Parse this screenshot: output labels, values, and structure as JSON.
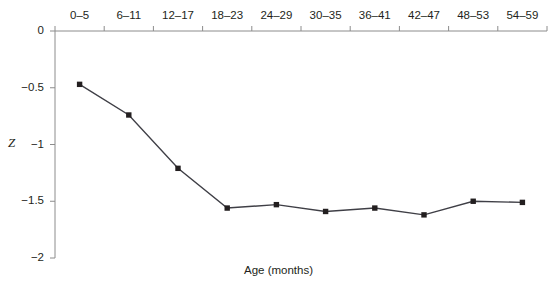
{
  "chart_data": {
    "type": "line",
    "title": "",
    "xlabel": "Age (months)",
    "ylabel": "Z",
    "categories": [
      "0–5",
      "6–11",
      "12–17",
      "18–23",
      "24–29",
      "30–35",
      "36–41",
      "42–47",
      "48–53",
      "54–59"
    ],
    "values": [
      -0.47,
      -0.74,
      -1.21,
      -1.56,
      -1.53,
      -1.59,
      -1.56,
      -1.62,
      -1.5,
      -1.51
    ],
    "series": [
      {
        "name": "Z",
        "values": [
          -0.47,
          -0.74,
          -1.21,
          -1.56,
          -1.53,
          -1.59,
          -1.56,
          -1.62,
          -1.5,
          -1.51
        ]
      }
    ],
    "ylim": [
      -2,
      0
    ],
    "yticks": [
      0,
      -0.5,
      -1,
      -1.5,
      -2
    ],
    "ytick_labels": [
      "0",
      "−0.5",
      "−1",
      "−1.5",
      "−2"
    ],
    "grid": false,
    "legend": false,
    "x_axis_position": "top",
    "marker": "square",
    "colors": {
      "line": "#3f3f46",
      "marker": "#231f20",
      "axis": "#808080",
      "text": "#231f20",
      "background": "#ffffff"
    }
  }
}
